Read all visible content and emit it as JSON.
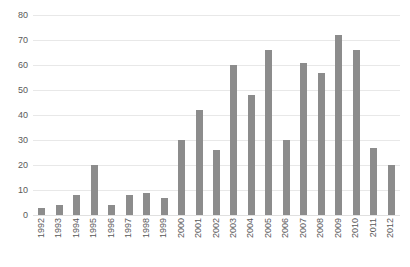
{
  "chart_data": {
    "type": "bar",
    "title": "",
    "subtitle": "",
    "xlabel": "",
    "ylabel": "",
    "grid": true,
    "legend": false,
    "legend_position": "none",
    "ylim": [
      0,
      80
    ],
    "ytick_interval": 10,
    "ytick_labels": [
      "0",
      "10",
      "20",
      "30",
      "40",
      "50",
      "60",
      "70",
      "80"
    ],
    "ytick_values": [
      0,
      10,
      20,
      30,
      40,
      50,
      60,
      70,
      80
    ],
    "categories": [
      "1992",
      "1993",
      "1994",
      "1995",
      "1996",
      "1997",
      "1998",
      "1999",
      "2000",
      "2001",
      "2002",
      "2003",
      "2004",
      "2005",
      "2006",
      "2007",
      "2008",
      "2009",
      "2010",
      "2011",
      "2012"
    ],
    "values": [
      3,
      4,
      8,
      20,
      4,
      8,
      9,
      7,
      30,
      42,
      26,
      60,
      48,
      66,
      30,
      61,
      57,
      72,
      66,
      27,
      20
    ],
    "series": [
      {
        "name": "",
        "color": "#8c8c8c",
        "values": [
          3,
          4,
          8,
          20,
          4,
          8,
          9,
          7,
          30,
          42,
          26,
          60,
          48,
          66,
          30,
          61,
          57,
          72,
          66,
          27,
          20
        ]
      }
    ],
    "colors": {
      "bar": "#8c8c8c",
      "gridline": "#e8e8e8",
      "axis_text": "#595959",
      "background": "#ffffff"
    }
  }
}
